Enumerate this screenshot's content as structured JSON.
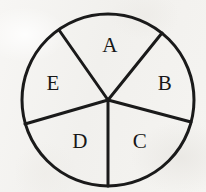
{
  "figure": {
    "kind": "circle-divided-into-sectors",
    "canvas": {
      "width": 206,
      "height": 192
    },
    "background_color": "#f4f3f1",
    "stroke_color": "#1a1a1a",
    "stroke_width": 3,
    "label_color": "#171717",
    "label_font_size": 21,
    "circle": {
      "cx": 108,
      "cy": 100,
      "r": 86
    },
    "center_point": {
      "x": 108,
      "y": 100
    },
    "sector_count": 5,
    "radii": [
      {
        "name": "radius-a-b",
        "angle_deg": -51,
        "x2": 162,
        "y2": 33
      },
      {
        "name": "radius-e-a",
        "angle_deg": -125,
        "x2": 59,
        "y2": 30
      },
      {
        "name": "radius-d-e",
        "angle_deg": 164,
        "x2": 25,
        "y2": 124
      },
      {
        "name": "radius-c-d",
        "angle_deg": 90,
        "x2": 108,
        "y2": 186
      },
      {
        "name": "radius-b-c",
        "angle_deg": 15,
        "x2": 191,
        "y2": 122
      }
    ],
    "sectors": [
      {
        "id": "A",
        "label": "A",
        "label_x": 110,
        "label_y": 47,
        "start_deg": -125,
        "end_deg": -51
      },
      {
        "id": "B",
        "label": "B",
        "label_x": 165,
        "label_y": 85,
        "start_deg": -51,
        "end_deg": 15
      },
      {
        "id": "C",
        "label": "C",
        "label_x": 140,
        "label_y": 143,
        "start_deg": 15,
        "end_deg": 90
      },
      {
        "id": "D",
        "label": "D",
        "label_x": 80,
        "label_y": 143,
        "start_deg": 90,
        "end_deg": 164
      },
      {
        "id": "E",
        "label": "E",
        "label_x": 53,
        "label_y": 85,
        "start_deg": 164,
        "end_deg": 235
      }
    ]
  }
}
